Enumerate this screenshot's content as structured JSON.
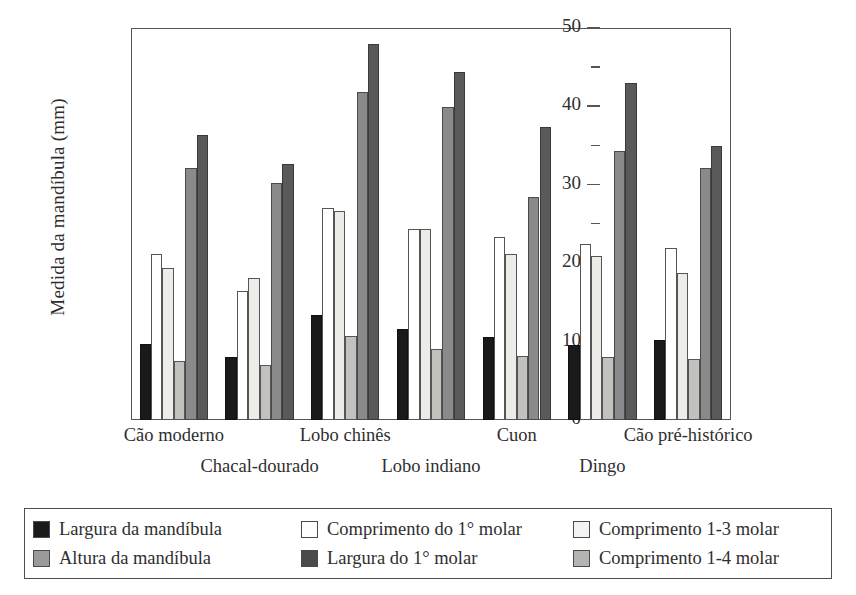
{
  "chart_data": {
    "type": "bar",
    "title": "",
    "subtitle": "",
    "xlabel": "",
    "ylabel": "Medida da mandíbula (mm)",
    "ylim": [
      0,
      50
    ],
    "yticks": [
      0,
      10,
      20,
      30,
      40,
      50
    ],
    "yticks_minor": [
      5,
      15,
      25,
      35,
      45
    ],
    "ytick_labels": [
      "0",
      "10",
      "20",
      "30",
      "40",
      "50"
    ],
    "grid": false,
    "legend_position": "below-plot",
    "categories": [
      "Cão moderno",
      "Chacal-dourado",
      "Lobo chinês",
      "Lobo indiano",
      "Cuon",
      "Dingo",
      "Cão pré-histórico"
    ],
    "series": [
      {
        "name": "Largura da mandíbula",
        "color": "#1a1a1a",
        "values": [
          9.7,
          8.0,
          13.4,
          11.6,
          10.6,
          9.6,
          10.2
        ]
      },
      {
        "name": "Comprimento do 1° molar",
        "color": "#ffffff",
        "values": [
          21.2,
          16.4,
          27.1,
          24.4,
          23.4,
          22.4,
          21.9
        ]
      },
      {
        "name": "Comprimento 1-3 molar",
        "color": "#eeece9",
        "values": [
          19.4,
          18.1,
          26.7,
          24.4,
          21.2,
          20.9,
          18.8
        ]
      },
      {
        "name": "Altura da mandíbula",
        "color": "#c3c1be",
        "values": [
          7.5,
          7.0,
          10.7,
          9.1,
          8.2,
          8.1,
          7.8
        ]
      },
      {
        "name": "Largura do 1° molar",
        "color": "#8a8a8a",
        "values": [
          32.2,
          30.2,
          41.9,
          39.9,
          28.5,
          34.3,
          32.1
        ]
      },
      {
        "name": "Comprimento 1-4 molar",
        "color": "#5a5a5a",
        "values": [
          36.3,
          32.7,
          48.0,
          44.4,
          37.4,
          43.0,
          34.9
        ]
      }
    ]
  },
  "legend": {
    "items": [
      {
        "label": "Largura da mandíbula",
        "swatch": "#1a1a1a"
      },
      {
        "label": "Comprimento do 1° molar",
        "swatch": "#ffffff"
      },
      {
        "label": "Comprimento 1-3 molar",
        "swatch": "#f4f3f1"
      },
      {
        "label": "Altura da mandíbula",
        "swatch": "#9a9a9a"
      },
      {
        "label": "Largura do 1° molar",
        "swatch": "#4a4a4a"
      },
      {
        "label": "Comprimento 1-4 molar",
        "swatch": "#b6b4b1"
      }
    ]
  }
}
